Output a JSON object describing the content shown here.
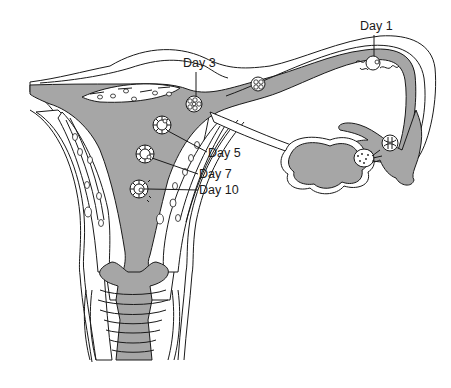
{
  "diagram": {
    "colors": {
      "cavity_fill": "#a6a6a6",
      "tissue_fill": "#ffffff",
      "line": "#1a1a1a"
    },
    "labels": [
      {
        "id": "day1",
        "text": "Day 1",
        "x": 416,
        "y": 30
      },
      {
        "id": "day3",
        "text": "Day 3",
        "x": 183,
        "y": 67
      },
      {
        "id": "day5",
        "text": "Day 5",
        "x": 208,
        "y": 157
      },
      {
        "id": "day7",
        "text": "Day 7",
        "x": 199,
        "y": 178
      },
      {
        "id": "day10",
        "text": "Day 10",
        "x": 199,
        "y": 194
      }
    ],
    "stages": [
      {
        "id": "day1",
        "desc": "fertilized-ovum",
        "cx": 373,
        "cy": 63,
        "r": 7
      },
      {
        "id": "day2",
        "desc": "4-cell-stage",
        "cx": 258,
        "cy": 84,
        "r": 7
      },
      {
        "id": "day3",
        "desc": "morula",
        "cx": 194,
        "cy": 104,
        "r": 8
      },
      {
        "id": "day5",
        "desc": "early-blastocyst",
        "cx": 162,
        "cy": 125,
        "r": 9
      },
      {
        "id": "day7",
        "desc": "blastocyst",
        "cx": 145,
        "cy": 154,
        "r": 9
      },
      {
        "id": "day10",
        "desc": "implanting-blastocyst",
        "cx": 139,
        "cy": 189,
        "r": 9
      }
    ]
  }
}
